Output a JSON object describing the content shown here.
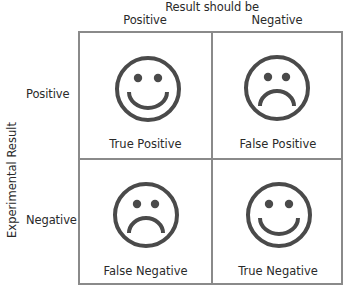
{
  "diagram": {
    "type": "confusion-matrix",
    "column_axis": {
      "title": "Result should be",
      "labels": [
        "Positive",
        "Negative"
      ]
    },
    "row_axis": {
      "title": "Experimental Result",
      "labels": [
        "Positive",
        "Negative"
      ]
    },
    "cells": [
      {
        "row": "Positive",
        "col": "Positive",
        "label": "True Positive",
        "face": "smile"
      },
      {
        "row": "Positive",
        "col": "Negative",
        "label": "False Positive",
        "face": "frown"
      },
      {
        "row": "Negative",
        "col": "Positive",
        "label": "False Negative",
        "face": "frown"
      },
      {
        "row": "Negative",
        "col": "Negative",
        "label": "True Negative",
        "face": "smile"
      }
    ],
    "colors": {
      "face_stroke": "#4a4a4a",
      "grid_line": "#8a8a8a",
      "text": "#2a2a2a",
      "background": "#ffffff"
    }
  }
}
